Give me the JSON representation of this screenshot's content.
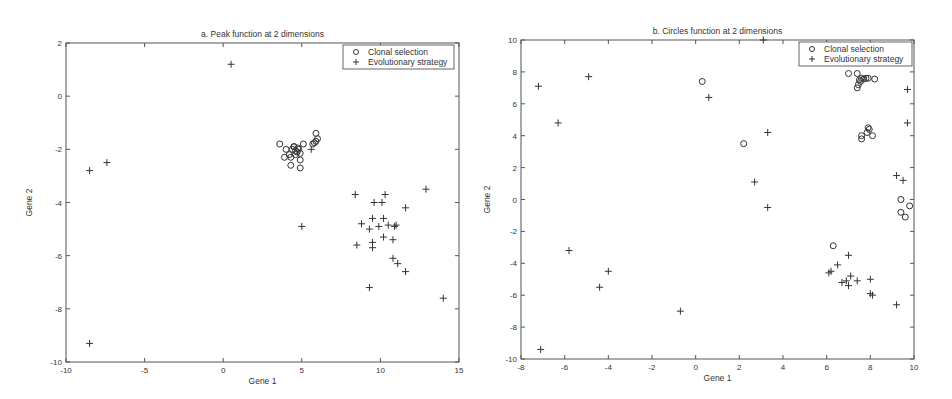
{
  "chart_data": [
    {
      "type": "scatter",
      "title": "a. Peak function at 2 dimensions",
      "xlabel": "Gene 1",
      "ylabel": "Gene 2",
      "xlim": [
        -10,
        15
      ],
      "ylim": [
        -10,
        2
      ],
      "xticks": [
        -10,
        -5,
        0,
        5,
        10,
        15
      ],
      "yticks": [
        -10,
        -8,
        -6,
        -4,
        -2,
        0,
        2
      ],
      "grid": false,
      "legend_position": "upper right",
      "legend": [
        "Clonal selection",
        "Evolutionary strategy"
      ],
      "series": [
        {
          "name": "Clonal selection",
          "marker": "circle",
          "points": [
            [
              3.6,
              -1.8
            ],
            [
              4.0,
              -2.0
            ],
            [
              4.2,
              -2.2
            ],
            [
              4.4,
              -2.0
            ],
            [
              4.5,
              -1.9
            ],
            [
              4.6,
              -2.05
            ],
            [
              4.7,
              -2.1
            ],
            [
              4.8,
              -2.0
            ],
            [
              4.9,
              -2.15
            ],
            [
              4.75,
              -1.95
            ],
            [
              4.6,
              -2.2
            ],
            [
              4.3,
              -2.3
            ],
            [
              3.9,
              -2.3
            ],
            [
              4.9,
              -2.4
            ],
            [
              4.3,
              -2.6
            ],
            [
              4.9,
              -2.7
            ],
            [
              5.1,
              -1.8
            ],
            [
              4.5,
              -1.9
            ],
            [
              5.7,
              -1.8
            ],
            [
              5.9,
              -1.7
            ],
            [
              6.0,
              -1.6
            ],
            [
              5.9,
              -1.4
            ],
            [
              5.8,
              -1.75
            ]
          ]
        },
        {
          "name": "Evolutionary strategy",
          "marker": "plus",
          "points": [
            [
              0.5,
              1.2
            ],
            [
              -8.5,
              -2.8
            ],
            [
              -7.4,
              -2.5
            ],
            [
              5.6,
              -2.0
            ],
            [
              5.0,
              -4.9
            ],
            [
              -8.5,
              -9.3
            ],
            [
              8.4,
              -3.7
            ],
            [
              10.3,
              -3.7
            ],
            [
              12.9,
              -3.5
            ],
            [
              9.6,
              -4.0
            ],
            [
              10.1,
              -4.0
            ],
            [
              11.6,
              -4.2
            ],
            [
              8.8,
              -4.8
            ],
            [
              9.5,
              -4.6
            ],
            [
              10.2,
              -4.6
            ],
            [
              9.3,
              -5.0
            ],
            [
              9.9,
              -4.9
            ],
            [
              10.5,
              -4.85
            ],
            [
              10.9,
              -4.9
            ],
            [
              11.0,
              -4.85
            ],
            [
              10.2,
              -5.3
            ],
            [
              10.8,
              -5.4
            ],
            [
              8.5,
              -5.6
            ],
            [
              9.5,
              -5.5
            ],
            [
              9.5,
              -5.7
            ],
            [
              10.8,
              -6.1
            ],
            [
              11.1,
              -6.3
            ],
            [
              11.6,
              -6.6
            ],
            [
              9.3,
              -7.2
            ],
            [
              14.0,
              -7.6
            ]
          ]
        }
      ]
    },
    {
      "type": "scatter",
      "title": "b. Circles function at 2 dimensions",
      "xlabel": "Gene 1",
      "ylabel": "Gene 2",
      "xlim": [
        -8,
        10
      ],
      "ylim": [
        -10,
        10
      ],
      "xticks": [
        -8,
        -6,
        -4,
        -2,
        0,
        2,
        4,
        6,
        8,
        10
      ],
      "yticks": [
        -10,
        -8,
        -6,
        -4,
        -2,
        0,
        2,
        4,
        6,
        8,
        10
      ],
      "grid": false,
      "legend_position": "upper right",
      "legend": [
        "Clonal selection",
        "Evolutionary strategy"
      ],
      "series": [
        {
          "name": "Clonal selection",
          "marker": "circle",
          "points": [
            [
              0.3,
              7.4
            ],
            [
              2.2,
              3.5
            ],
            [
              7.0,
              7.9
            ],
            [
              7.4,
              7.9
            ],
            [
              7.5,
              7.5
            ],
            [
              7.6,
              7.6
            ],
            [
              7.7,
              7.55
            ],
            [
              7.8,
              7.6
            ],
            [
              7.9,
              7.6
            ],
            [
              8.2,
              7.55
            ],
            [
              7.4,
              7.0
            ],
            [
              7.45,
              7.2
            ],
            [
              7.55,
              7.4
            ],
            [
              7.6,
              4.0
            ],
            [
              7.6,
              3.8
            ],
            [
              7.9,
              4.5
            ],
            [
              7.95,
              4.4
            ],
            [
              8.1,
              4.0
            ],
            [
              7.85,
              4.2
            ],
            [
              9.4,
              0.0
            ],
            [
              9.8,
              -0.4
            ],
            [
              9.4,
              -0.8
            ],
            [
              9.6,
              -1.1
            ],
            [
              6.3,
              -2.9
            ]
          ]
        },
        {
          "name": "Evolutionary strategy",
          "marker": "plus",
          "points": [
            [
              -7.2,
              7.1
            ],
            [
              -4.9,
              7.7
            ],
            [
              -6.3,
              4.8
            ],
            [
              0.6,
              6.4
            ],
            [
              3.1,
              10.0
            ],
            [
              3.3,
              4.2
            ],
            [
              2.7,
              1.1
            ],
            [
              3.3,
              -0.5
            ],
            [
              9.7,
              6.9
            ],
            [
              9.7,
              4.8
            ],
            [
              9.2,
              1.5
            ],
            [
              9.5,
              1.2
            ],
            [
              -5.8,
              -3.2
            ],
            [
              -4.4,
              -5.5
            ],
            [
              -4.0,
              -4.5
            ],
            [
              -0.7,
              -7.0
            ],
            [
              -7.1,
              -9.4
            ],
            [
              7.0,
              -3.5
            ],
            [
              6.5,
              -4.1
            ],
            [
              6.1,
              -4.6
            ],
            [
              6.2,
              -4.5
            ],
            [
              7.1,
              -4.8
            ],
            [
              6.7,
              -5.2
            ],
            [
              6.9,
              -5.1
            ],
            [
              7.0,
              -5.4
            ],
            [
              7.4,
              -5.1
            ],
            [
              8.0,
              -5.0
            ],
            [
              8.0,
              -5.9
            ],
            [
              8.1,
              -6.0
            ],
            [
              9.2,
              -6.6
            ]
          ]
        }
      ]
    }
  ]
}
